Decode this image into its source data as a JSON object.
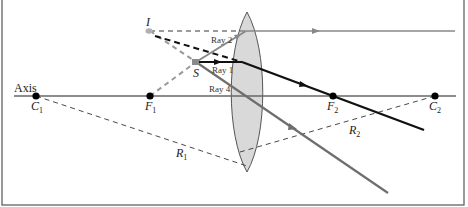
{
  "diagram": {
    "labels": {
      "axis": "Axis",
      "c1": "C",
      "c1_sub": "1",
      "f1": "F",
      "f1_sub": "1",
      "f2": "F",
      "f2_sub": "2",
      "c2": "C",
      "c2_sub": "2",
      "r1": "R",
      "r1_sub": "1",
      "r2": "R",
      "r2_sub": "2",
      "image": "I",
      "source": "S",
      "ray1": "Ray 1",
      "ray2": "Ray 2",
      "ray4": "Ray 4"
    },
    "colors": {
      "frame": "#555555",
      "axis": "#666666",
      "lens_fill": "#d9d9d9",
      "lens_stroke": "#555555",
      "ray_black": "#111111",
      "ray_gray": "#777777",
      "dash_gray": "#9a9a9a",
      "point": "#000000"
    },
    "points": {
      "C1": [
        36,
        96
      ],
      "F1": [
        150,
        96
      ],
      "F2": [
        333,
        96
      ],
      "C2": [
        435,
        96
      ],
      "I": [
        150,
        31
      ],
      "S": [
        196,
        62
      ]
    }
  }
}
